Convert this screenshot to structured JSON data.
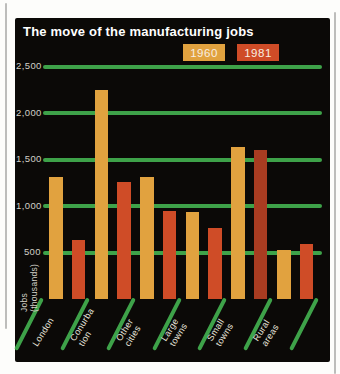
{
  "title": "The move of the manufacturing jobs",
  "colors": {
    "panel_background": "#0b0907",
    "page_background": "#fdfdfb",
    "gridline_green": "#3ea249",
    "series_1960": "#e1a23f",
    "series_1981": "#cf4c27",
    "series_1981_dark_variant": "#a93c21",
    "tick_text": "#d2cfc6",
    "title_text": "#ffffff",
    "category_text": "#e8e5dc",
    "scan_line": "#bdbdbb"
  },
  "legend": {
    "items": [
      {
        "label": "1960",
        "color": "#e1a23f"
      },
      {
        "label": "1981",
        "color": "#cf4c27"
      }
    ]
  },
  "y_axis": {
    "title_line1": "Jobs",
    "title_line2": "(thousands)",
    "ticks": [
      "2,500",
      "2,000",
      "1,500",
      "1,000",
      "500"
    ],
    "tick_values": [
      2500,
      2000,
      1500,
      1000,
      500
    ]
  },
  "chart_data": {
    "type": "bar",
    "title": "The move of the manufacturing jobs",
    "xlabel": "",
    "ylabel": "Jobs (thousands)",
    "ylim": [
      0,
      2700
    ],
    "grid": "horizontal",
    "legend_position": "top-right",
    "categories": [
      "London",
      "Conurbation",
      "Other cities",
      "Large towns",
      "Small towns",
      "Rural areas"
    ],
    "category_display": [
      [
        "London"
      ],
      [
        "Conurba",
        "tion"
      ],
      [
        "Other",
        "cities"
      ],
      [
        "Large",
        "towns"
      ],
      [
        "Small",
        "towns"
      ],
      [
        "Rural",
        "areas"
      ]
    ],
    "series": [
      {
        "name": "1960",
        "color": "#e1a23f",
        "values": [
          1310,
          2250,
          1310,
          940,
          1630,
          530
        ]
      },
      {
        "name": "1981",
        "color": "#cf4c27",
        "bar_colors": [
          "#cf4c27",
          "#cf4c27",
          "#cf4c27",
          "#cf4c27",
          "#a93c21",
          "#cf4c27"
        ],
        "values": [
          630,
          1260,
          950,
          760,
          1600,
          590
        ]
      }
    ]
  }
}
